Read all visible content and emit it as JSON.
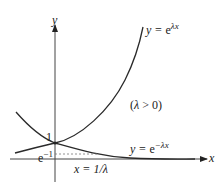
{
  "axes": {
    "x_label": "x",
    "y_label": "y"
  },
  "curves": {
    "growth": {
      "lhs": "y = ",
      "base": "e",
      "exp": "λx"
    },
    "decay": {
      "lhs": "y = ",
      "base": "e",
      "exp": "−λx"
    }
  },
  "annotations": {
    "condition": "(λ > 0)",
    "intercept": "1",
    "e_inverse_base": "e",
    "e_inverse_exp": "−1",
    "x_marker": "x = 1/λ"
  },
  "colors": {
    "curve": "#2a2a2a",
    "axis": "#333333",
    "dashed": "#777777"
  }
}
